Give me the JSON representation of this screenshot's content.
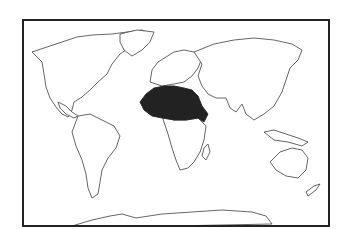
{
  "map": {
    "type": "world-outline-map",
    "highlighted_region": "North Africa / Sahel",
    "highlight_color": "#222222",
    "outline_color": "#555555",
    "background_color": "#ffffff",
    "frame_color": "#222222"
  }
}
